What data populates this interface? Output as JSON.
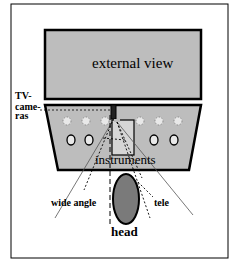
{
  "diagram": {
    "labels": {
      "external_view": "external view",
      "tv_cameras_line1": "TV-",
      "tv_cameras_line2": "came-",
      "tv_cameras_line3": "ras",
      "instruments": "instruments",
      "wide_angle": "wide angle",
      "tele": "tele",
      "head": "head"
    },
    "colors": {
      "panel_fill": "#bdbdbd",
      "head_fill": "#7a7a7a",
      "instrument_fill": "#d6d6d6",
      "stroke": "#000000",
      "background": "#ffffff"
    }
  }
}
